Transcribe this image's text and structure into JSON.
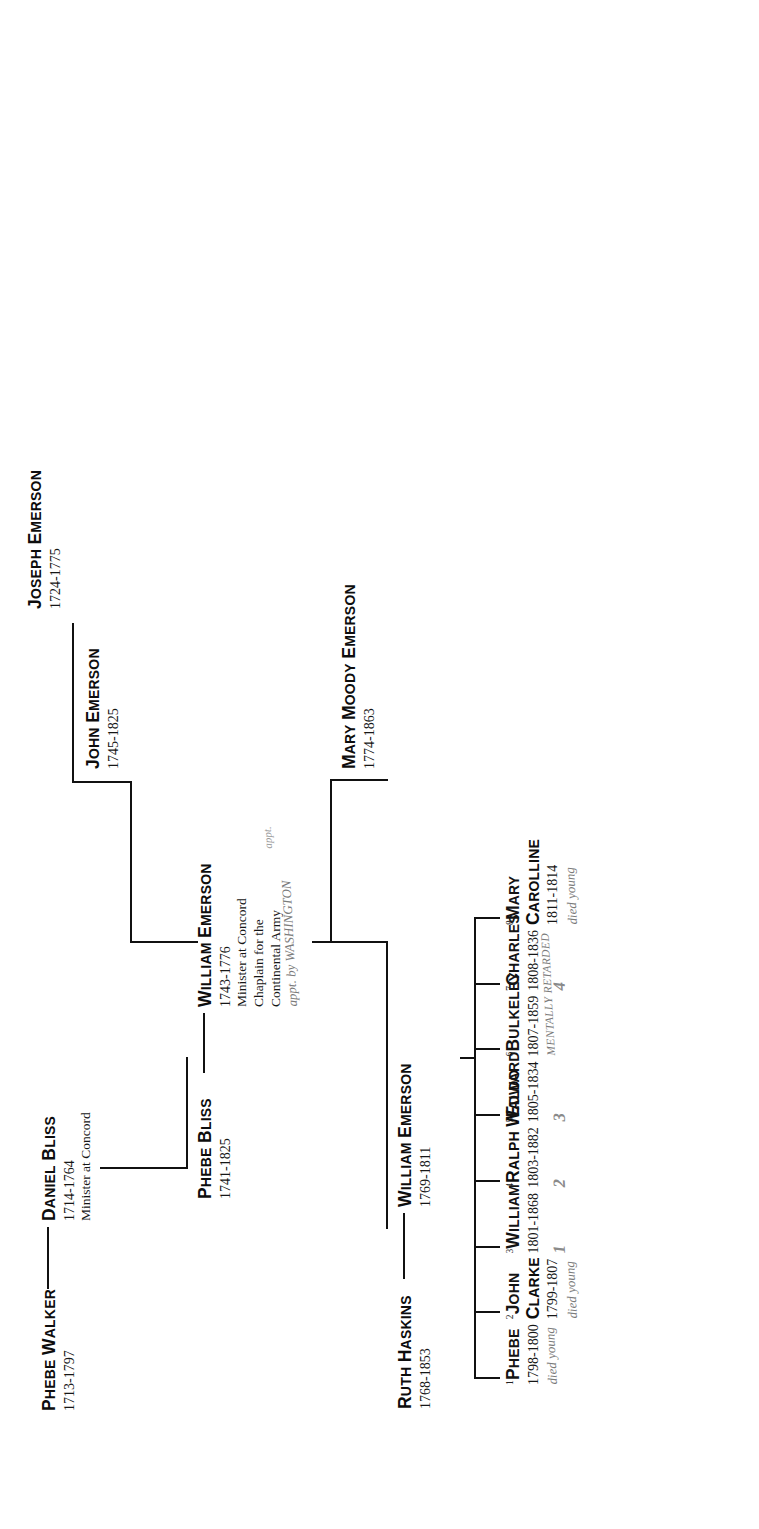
{
  "chart": {
    "orientation": "sideways (rotated 90 degrees)",
    "ink_color": "#111111",
    "handwriting_color": "#7b7b7b"
  },
  "generation1": {
    "phebe_walker": {
      "name": "Phebe Walker",
      "dates": "1713-1797"
    },
    "daniel_bliss": {
      "name": "Daniel Bliss",
      "dates": "1714-1764",
      "note": "Minister at Concord"
    }
  },
  "generation2": {
    "phebe_bliss": {
      "name": "Phebe Bliss",
      "dates": "1741-1825"
    },
    "william_emerson_1743": {
      "name": "William Emerson",
      "dates": "1743-1776",
      "note_line1": "Minister at Concord",
      "note_line2": "Chaplain for the",
      "note_line3": "Continental Army",
      "handwritten_small": "appt.",
      "handwritten": "appt. by WASHINGTON"
    },
    "john_emerson": {
      "name": "John Emerson",
      "dates": "1745-1825"
    },
    "joseph_emerson": {
      "name": "Joseph Emerson",
      "dates": "1724-1775"
    }
  },
  "generation3": {
    "ruth_haskins": {
      "name": "Ruth Haskins",
      "dates": "1768-1853"
    },
    "william_emerson_1769": {
      "name": "William Emerson",
      "dates": "1769-1811"
    },
    "mary_moody_emerson": {
      "name": "Mary Moody Emerson",
      "dates": "1774-1863"
    }
  },
  "children": [
    {
      "order": "1",
      "name": "Phebe",
      "name2": "",
      "dates": "1798-1800",
      "hand_note": "died young",
      "hand_num": "",
      "bold": false
    },
    {
      "order": "2",
      "name": "John",
      "name2": "Clarke",
      "dates": "1799-1807",
      "hand_note": "died young",
      "hand_num": "",
      "bold": false
    },
    {
      "order": "3",
      "name": "William",
      "name2": "",
      "dates": "1801-1868",
      "hand_note": "",
      "hand_num": "1",
      "bold": false
    },
    {
      "order": "4",
      "name": "Ralph Waldo",
      "name2": "",
      "dates": "1803-1882",
      "hand_note": "",
      "hand_num": "2",
      "bold": true
    },
    {
      "order": "5",
      "name": "Edward",
      "name2": "",
      "dates": "1805-1834",
      "hand_note": "",
      "hand_num": "3",
      "bold": false
    },
    {
      "order": "6",
      "name": "Bulkeley",
      "name2": "",
      "dates": "1807-1859",
      "hand_note": "MENTALLY RETARDED",
      "hand_num": "",
      "bold": false
    },
    {
      "order": "7",
      "name": "Charles",
      "name2": "",
      "dates": "1808-1836",
      "hand_note": "",
      "hand_num": "4",
      "bold": false
    },
    {
      "order": "8",
      "name": "Mary",
      "name2": "Carolline",
      "dates": "1811-1814",
      "hand_note": "died young",
      "hand_num": "",
      "bold": false
    }
  ],
  "marriage_dash": "——————"
}
